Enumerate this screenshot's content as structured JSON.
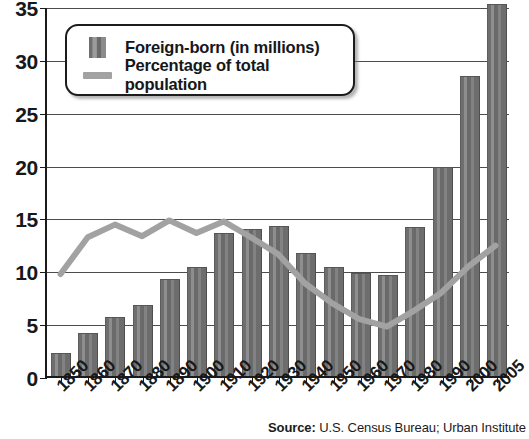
{
  "chart_data": {
    "type": "bar",
    "title": "",
    "subtitle": "",
    "xlabel": "",
    "ylabel": "",
    "ylim": [
      0,
      35
    ],
    "yticks": [
      0,
      5,
      10,
      15,
      20,
      25,
      30,
      35
    ],
    "grid": true,
    "legend_position": "top-left",
    "categories": [
      "1850",
      "1860",
      "1870",
      "1880",
      "1890",
      "1900",
      "1910",
      "1920",
      "1930",
      "1940",
      "1950",
      "1960",
      "1970",
      "1980",
      "1990",
      "2000",
      "2005"
    ],
    "series": [
      {
        "name": "Foreign-born (in millions)",
        "type": "bar",
        "color": "#767676",
        "values": [
          2.2,
          4.1,
          5.6,
          6.7,
          9.2,
          10.3,
          13.5,
          13.9,
          14.2,
          11.6,
          10.3,
          9.7,
          9.6,
          14.1,
          19.8,
          28.4,
          35.2
        ]
      },
      {
        "name": "Percentage of total population",
        "type": "line",
        "color": "#a2a2a2",
        "values": [
          9.7,
          13.2,
          14.4,
          13.3,
          14.8,
          13.6,
          14.7,
          13.2,
          11.6,
          8.8,
          6.9,
          5.4,
          4.7,
          6.2,
          7.9,
          10.4,
          12.4
        ]
      }
    ]
  },
  "legend": {
    "items": [
      {
        "swatch": "bar-swatch",
        "label": "Foreign-born (in millions)"
      },
      {
        "swatch": "line-swatch",
        "label": "Percentage of total population"
      }
    ]
  },
  "source": {
    "prefix": "Source:",
    "text": " U.S. Census Bureau; Urban Institute"
  }
}
